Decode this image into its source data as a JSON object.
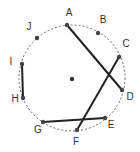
{
  "diagram": {
    "circle": {
      "cx": 72,
      "cy": 78,
      "r": 53,
      "stroke": "#666666",
      "dash": "2,2"
    },
    "center": {
      "x": 72,
      "y": 79
    },
    "points": [
      {
        "id": "A",
        "x": 67,
        "y": 25,
        "lx": 69,
        "ly": 16
      },
      {
        "id": "B",
        "x": 98,
        "y": 33,
        "lx": 103,
        "ly": 23
      },
      {
        "id": "C",
        "x": 119,
        "y": 57,
        "lx": 126,
        "ly": 47
      },
      {
        "id": "D",
        "x": 122,
        "y": 90,
        "lx": 130,
        "ly": 100
      },
      {
        "id": "E",
        "x": 105,
        "y": 118,
        "lx": 111,
        "ly": 128
      },
      {
        "id": "F",
        "x": 77,
        "y": 130,
        "lx": 76,
        "ly": 145
      },
      {
        "id": "G",
        "x": 43,
        "y": 122,
        "lx": 38,
        "ly": 133
      },
      {
        "id": "H",
        "x": 23,
        "y": 98,
        "lx": 15,
        "ly": 102
      },
      {
        "id": "I",
        "x": 22,
        "y": 64,
        "lx": 11,
        "ly": 65
      },
      {
        "id": "J",
        "x": 37,
        "y": 38,
        "lx": 29,
        "ly": 30
      }
    ],
    "chords": [
      {
        "from": "A",
        "to": "D"
      },
      {
        "from": "C",
        "to": "F"
      },
      {
        "from": "G",
        "to": "E"
      },
      {
        "from": "I",
        "to": "H"
      }
    ]
  }
}
